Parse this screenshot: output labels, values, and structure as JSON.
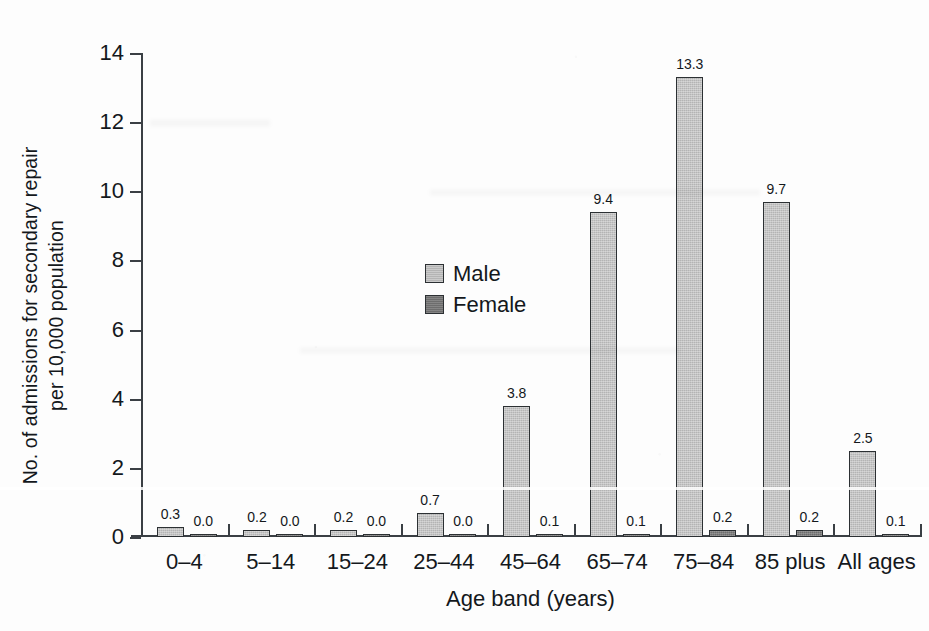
{
  "chart_data": {
    "type": "bar",
    "title": "",
    "subtitle": "",
    "xlabel": "Age band (years)",
    "ylabel": "No. of admissions for secondary repair per 10,000 population",
    "ylabel_line1": "No. of admissions for secondary repair",
    "ylabel_line2": "per 10,000 population",
    "categories": [
      "0–4",
      "5–14",
      "15–24",
      "25–44",
      "45–64",
      "65–74",
      "75–84",
      "85 plus",
      "All ages"
    ],
    "series": [
      {
        "name": "Male",
        "color": "#b4b4b4",
        "values": [
          0.3,
          0.2,
          0.2,
          0.7,
          3.8,
          9.4,
          13.3,
          9.7,
          2.5
        ],
        "labels": [
          "0.3",
          "0.2",
          "0.2",
          "0.7",
          "3.8",
          "9.4",
          "13.3",
          "9.7",
          "2.5"
        ]
      },
      {
        "name": "Female",
        "color": "#6d6d6d",
        "values": [
          0.0,
          0.0,
          0.0,
          0.0,
          0.1,
          0.1,
          0.2,
          0.2,
          0.1
        ],
        "labels": [
          "0.0",
          "0.0",
          "0.0",
          "0.0",
          "0.1",
          "0.1",
          "0.2",
          "0.2",
          "0.1"
        ]
      }
    ],
    "ylim": [
      0,
      14
    ],
    "yticks": [
      0,
      2,
      4,
      6,
      8,
      10,
      12,
      14
    ],
    "ytick_labels": [
      "0",
      "2",
      "4",
      "6",
      "8",
      "10",
      "12",
      "14"
    ],
    "grid": false,
    "legend_position": "upper-left-inside",
    "data_labels_shown": true
  },
  "legend": {
    "entries": [
      {
        "label": "Male"
      },
      {
        "label": "Female"
      }
    ]
  },
  "axes": {
    "y_title_line1": "No. of admissions for secondary repair",
    "y_title_line2": "per 10,000 population",
    "x_title": "Age band (years)"
  }
}
